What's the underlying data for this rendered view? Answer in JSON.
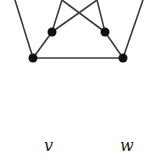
{
  "diagram": {
    "type": "graph",
    "colors": {
      "edge": "#3a3a3a",
      "node": "#111111",
      "background": "#ffffff"
    },
    "nodes": [
      {
        "id": "bl",
        "x": 33,
        "y": 58
      },
      {
        "id": "br",
        "x": 123,
        "y": 58
      },
      {
        "id": "ml",
        "x": 52,
        "y": 32
      },
      {
        "id": "mr",
        "x": 105,
        "y": 32
      }
    ],
    "edges": [
      {
        "from": "bl",
        "to": "br"
      },
      {
        "from": "bl",
        "to": "ml"
      },
      {
        "from": "br",
        "to": "mr"
      },
      {
        "from": "bl",
        "to": "top-left-outer"
      },
      {
        "from": "br",
        "to": "top-right-outer"
      },
      {
        "from": "ml",
        "to": "top-inner-left"
      },
      {
        "from": "ml",
        "to": "top-inner-right"
      },
      {
        "from": "mr",
        "to": "top-inner-right"
      },
      {
        "from": "mr",
        "to": "top-inner-left"
      }
    ],
    "labels": [
      {
        "text": "v",
        "x": 49,
        "y": 151
      },
      {
        "text": "w",
        "x": 127,
        "y": 151
      }
    ]
  }
}
